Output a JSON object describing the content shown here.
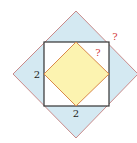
{
  "diagram": {
    "outer_diamond": {
      "fill": "#d4e9f2",
      "stroke": "#c98a8a"
    },
    "square": {
      "fill": "#ffffff",
      "stroke": "#333333"
    },
    "inner_diamond": {
      "fill": "#fcf3b0",
      "stroke": "#d9894a"
    },
    "labels": {
      "left_side": "2",
      "bottom_side": "2",
      "inner_question": "?",
      "outer_question": "?"
    },
    "label_colors": {
      "number": "#222222",
      "question": "#d23a3a"
    }
  }
}
